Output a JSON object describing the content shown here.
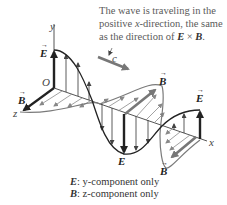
{
  "caption": {
    "line1": "The wave is traveling in the",
    "line2_pre": "positive ",
    "line2_axis": "x",
    "line2_post": "-direction, the same",
    "line3_pre": "as the direction of ",
    "vec_E": "E",
    "cross": " × ",
    "vec_B": "B",
    "line3_post": "."
  },
  "axes": {
    "y": "y",
    "x": "x",
    "z": "z",
    "origin": "O"
  },
  "labels": {
    "speed": "c",
    "E": "E",
    "B": "B"
  },
  "legend": {
    "E_vec": "E",
    "E_text": ": y-component only",
    "B_vec": "B",
    "B_text": ": z-component only"
  },
  "colors": {
    "E_wave": "#2a2a2a",
    "B_wave": "#7a7a7a",
    "axis": "#555555",
    "text": "#5a5a5a"
  }
}
